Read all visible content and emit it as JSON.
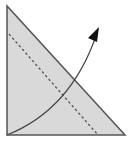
{
  "diagram": {
    "type": "origami-fold-step",
    "colors": {
      "background": "#ffffff",
      "paper_fill": "#d9d9d9",
      "outline": "#555555",
      "fold_line": "#555555",
      "arrow": "#444444",
      "arrow_head": "#111111"
    },
    "triangle": {
      "points": "7,6 7,135 125,135"
    },
    "fold_line": {
      "x1": 9,
      "y1": 34,
      "x2": 98,
      "y2": 135,
      "style": "dashed"
    },
    "arrow": {
      "path": "M7,135 Q70,110 96,36",
      "head": "99,27 88,38 97,42"
    }
  }
}
